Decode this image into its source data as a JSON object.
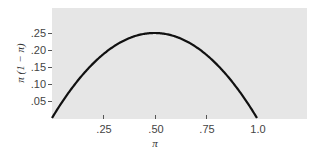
{
  "chart_data": {
    "type": "line",
    "title": "",
    "xlabel": "π",
    "ylabel": "π (1 − π)",
    "xlim": [
      0,
      1.25
    ],
    "ylim": [
      0,
      0.32
    ],
    "grid": false,
    "legend": null,
    "x_ticks": [
      ".25",
      ".50",
      ".75",
      "1.0"
    ],
    "y_ticks": [
      ".05",
      ".10",
      ".15",
      ".20",
      ".25"
    ],
    "series": [
      {
        "name": "π(1 − π)",
        "x": [
          0,
          0.05,
          0.1,
          0.2,
          0.3,
          0.4,
          0.5,
          0.6,
          0.7,
          0.8,
          0.9,
          0.95,
          1.0
        ],
        "values": [
          0,
          0.0475,
          0.09,
          0.16,
          0.21,
          0.24,
          0.25,
          0.24,
          0.21,
          0.16,
          0.09,
          0.0475,
          0
        ]
      }
    ],
    "colors": {
      "curve": "#111111",
      "plot_background": "#e6e6e6"
    }
  }
}
